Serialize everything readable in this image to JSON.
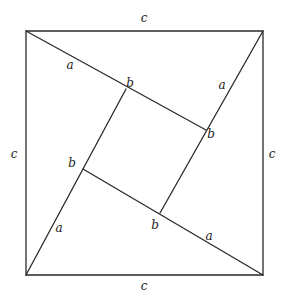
{
  "diagram": {
    "type": "geometric-proof",
    "outer_square": {
      "corners": {
        "top_left": [
          26,
          31
        ],
        "top_right": [
          263,
          31
        ],
        "bottom_right": [
          263,
          275
        ],
        "bottom_left": [
          26,
          275
        ]
      }
    },
    "inner_square": {
      "vertices": {
        "top": [
          126,
          89
        ],
        "right": [
          206,
          130
        ],
        "bottom": [
          160,
          213
        ],
        "left": [
          83,
          169
        ]
      }
    },
    "labels": {
      "side_top": {
        "text": "c",
        "x": 144,
        "y": 22
      },
      "side_left": {
        "text": "c",
        "x": 14,
        "y": 158
      },
      "side_right": {
        "text": "c",
        "x": 272,
        "y": 158
      },
      "side_bottom": {
        "text": "c",
        "x": 144,
        "y": 290
      },
      "leg_a_top": {
        "text": "a",
        "x": 70,
        "y": 69
      },
      "leg_b_top": {
        "text": "b",
        "x": 130,
        "y": 87
      },
      "leg_a_right": {
        "text": "a",
        "x": 222,
        "y": 89
      },
      "leg_b_right": {
        "text": "b",
        "x": 211,
        "y": 138
      },
      "leg_b_left": {
        "text": "b",
        "x": 72,
        "y": 167
      },
      "leg_a_left": {
        "text": "a",
        "x": 59,
        "y": 232
      },
      "leg_b_bottom": {
        "text": "b",
        "x": 155,
        "y": 229
      },
      "leg_a_bottom": {
        "text": "a",
        "x": 209,
        "y": 240
      }
    },
    "colors": {
      "stroke": "#2a2a2a",
      "text": "#222222",
      "background": "#ffffff"
    }
  }
}
